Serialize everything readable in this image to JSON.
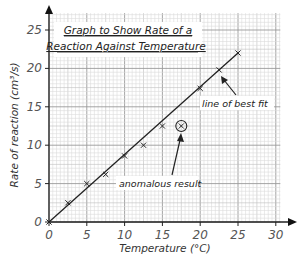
{
  "chart_data": {
    "type": "scatter",
    "title": "Graph to Show Rate of a Reaction Against Temperature",
    "title_lines": [
      "Graph to Show Rate of a",
      "Reaction Against Temperature"
    ],
    "xlabel": "Temperature (°C)",
    "ylabel": "Rate of reaction (cm³/s)",
    "xlim": [
      0,
      30
    ],
    "ylim": [
      0,
      27
    ],
    "x_ticks": [
      0,
      5,
      10,
      15,
      20,
      25,
      30
    ],
    "y_ticks": [
      0,
      5,
      10,
      15,
      20,
      25
    ],
    "grid": true,
    "legend": null,
    "series": [
      {
        "name": "Measured rate",
        "marker": "x",
        "points": [
          {
            "x": 0,
            "y": 0
          },
          {
            "x": 2.5,
            "y": 2.5
          },
          {
            "x": 5,
            "y": 5
          },
          {
            "x": 7.5,
            "y": 6.2
          },
          {
            "x": 10,
            "y": 8.6
          },
          {
            "x": 12.5,
            "y": 10
          },
          {
            "x": 15,
            "y": 12.5
          },
          {
            "x": 20,
            "y": 17.4
          },
          {
            "x": 22.5,
            "y": 19.8
          },
          {
            "x": 25,
            "y": 22
          }
        ]
      },
      {
        "name": "Anomalous result",
        "marker": "circled-x",
        "points": [
          {
            "x": 17.5,
            "y": 12.5
          }
        ]
      }
    ],
    "line_of_best_fit": {
      "from": {
        "x": 0,
        "y": 0
      },
      "to": {
        "x": 25,
        "y": 22
      }
    },
    "annotations": [
      {
        "text": "line of best fit",
        "label_at": {
          "x": 23.2,
          "y": 16.3
        },
        "arrow_to": {
          "x": 22.8,
          "y": 19.0
        }
      },
      {
        "text": "anomalous result",
        "label_at": {
          "x": 13,
          "y": 5.0
        },
        "arrow_to": {
          "x": 17.4,
          "y": 11.6
        }
      }
    ]
  },
  "labels": {
    "title_line_1": "Graph to Show Rate of a",
    "title_line_2": "Reaction Against Temperature",
    "xlabel": "Temperature (°C)",
    "ylabel": "Rate of reaction (cm³/s)",
    "annotation_best_fit": "line of best fit",
    "annotation_anomalous": "anomalous result"
  }
}
